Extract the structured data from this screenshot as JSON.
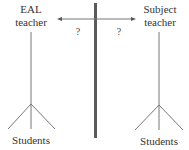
{
  "diagram": {
    "left_node": {
      "title_line1": "EAL",
      "title_line2": "teacher",
      "group_label": "Students"
    },
    "right_node": {
      "title_line1": "Subject",
      "title_line2": "teacher",
      "group_label": "Students"
    },
    "connector": {
      "left_question": "?",
      "right_question": "?",
      "type": "double-headed-arrow"
    },
    "divider": {
      "type": "vertical-bar"
    },
    "colors": {
      "line": "#555555",
      "divider": "#5a5a5a",
      "text": "#333333"
    }
  }
}
